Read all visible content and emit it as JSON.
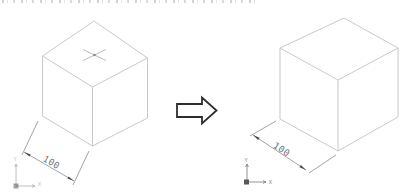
{
  "left_view": {
    "dimension_label": "100",
    "ucs": {
      "y_label": "Y",
      "x_label": "X"
    }
  },
  "right_view": {
    "dimension_label": "100",
    "ucs": {
      "y_label": "Y",
      "x_label": "X"
    }
  },
  "icons": {
    "transform_arrow": "block-right-arrow",
    "center_mark": "isometric-cross-center-mark",
    "ucs": "xy-axis-icon"
  },
  "colors": {
    "background": "#ffffff",
    "cube_edge": "#c7c9cc",
    "center_mark": "#bcbec2",
    "center_dot": "#8a8d91",
    "dimension_line": "#95989c",
    "dimension_arrow": "#4a4d50",
    "dimension_text": "#6f7276",
    "transform_arrow": "#2d2d2f",
    "ucs_left": "#b4b7bb",
    "ucs_right": "#84878b",
    "ucs_origin": "#55585c"
  }
}
